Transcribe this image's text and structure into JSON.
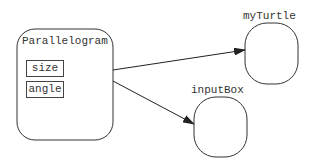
{
  "diagram": {
    "type": "object-reference-diagram",
    "nodes": [
      {
        "id": "parallelogram",
        "label": "Parallelogram",
        "fields": [
          "size",
          "angle"
        ]
      },
      {
        "id": "myTurtle",
        "label": "myTurtle"
      },
      {
        "id": "inputBox",
        "label": "inputBox"
      }
    ],
    "edges": [
      {
        "from": "parallelogram",
        "to": "myTurtle"
      },
      {
        "from": "parallelogram",
        "to": "inputBox"
      }
    ],
    "colors": {
      "stroke": "#333333",
      "background": "#ffffff"
    }
  }
}
